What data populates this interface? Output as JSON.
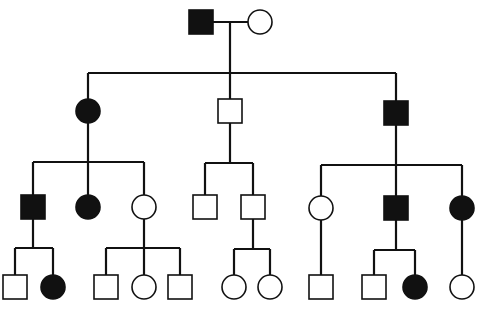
{
  "diagram": {
    "type": "pedigree",
    "colors": {
      "affected": "#111111",
      "unaffected": "#ffffff",
      "line": "#111111"
    },
    "legend_semantics": {
      "square": "male",
      "circle": "female",
      "filled": "affected",
      "open": "unaffected"
    },
    "individuals": [
      {
        "id": "I-1",
        "gen": 1,
        "sex": "male",
        "affected": true,
        "x": 201,
        "y": 22
      },
      {
        "id": "I-2",
        "gen": 1,
        "sex": "female",
        "affected": false,
        "x": 260,
        "y": 22
      },
      {
        "id": "II-1",
        "gen": 2,
        "sex": "female",
        "affected": true,
        "x": 88,
        "y": 111
      },
      {
        "id": "II-2",
        "gen": 2,
        "sex": "male",
        "affected": false,
        "x": 230,
        "y": 111
      },
      {
        "id": "II-3",
        "gen": 2,
        "sex": "male",
        "affected": true,
        "x": 396,
        "y": 113
      },
      {
        "id": "III-1",
        "gen": 3,
        "sex": "male",
        "affected": true,
        "x": 33,
        "y": 207
      },
      {
        "id": "III-2",
        "gen": 3,
        "sex": "female",
        "affected": true,
        "x": 88,
        "y": 207
      },
      {
        "id": "III-3",
        "gen": 3,
        "sex": "female",
        "affected": false,
        "x": 144,
        "y": 207
      },
      {
        "id": "III-4",
        "gen": 3,
        "sex": "male",
        "affected": false,
        "x": 205,
        "y": 207
      },
      {
        "id": "III-5",
        "gen": 3,
        "sex": "male",
        "affected": false,
        "x": 253,
        "y": 207
      },
      {
        "id": "III-6",
        "gen": 3,
        "sex": "female",
        "affected": false,
        "x": 321,
        "y": 208
      },
      {
        "id": "III-7",
        "gen": 3,
        "sex": "male",
        "affected": true,
        "x": 396,
        "y": 208
      },
      {
        "id": "III-8",
        "gen": 3,
        "sex": "female",
        "affected": true,
        "x": 462,
        "y": 208
      },
      {
        "id": "IV-1",
        "gen": 4,
        "sex": "male",
        "affected": false,
        "x": 15,
        "y": 287
      },
      {
        "id": "IV-2",
        "gen": 4,
        "sex": "female",
        "affected": true,
        "x": 53,
        "y": 287
      },
      {
        "id": "IV-3",
        "gen": 4,
        "sex": "male",
        "affected": false,
        "x": 106,
        "y": 287
      },
      {
        "id": "IV-4",
        "gen": 4,
        "sex": "female",
        "affected": false,
        "x": 144,
        "y": 287
      },
      {
        "id": "IV-5",
        "gen": 4,
        "sex": "male",
        "affected": false,
        "x": 180,
        "y": 287
      },
      {
        "id": "IV-6",
        "gen": 4,
        "sex": "female",
        "affected": false,
        "x": 234,
        "y": 287
      },
      {
        "id": "IV-7",
        "gen": 4,
        "sex": "female",
        "affected": false,
        "x": 270,
        "y": 287
      },
      {
        "id": "IV-8",
        "gen": 4,
        "sex": "male",
        "affected": false,
        "x": 321,
        "y": 287
      },
      {
        "id": "IV-9",
        "gen": 4,
        "sex": "male",
        "affected": false,
        "x": 374,
        "y": 287
      },
      {
        "id": "IV-10",
        "gen": 4,
        "sex": "female",
        "affected": true,
        "x": 415,
        "y": 287
      },
      {
        "id": "IV-11",
        "gen": 4,
        "sex": "female",
        "affected": false,
        "x": 462,
        "y": 287
      }
    ],
    "lines": [
      {
        "kind": "marriage",
        "x1": 213,
        "y1": 22,
        "x2": 248,
        "y2": 22
      },
      {
        "kind": "descent",
        "x1": 230,
        "y1": 22,
        "x2": 230,
        "y2": 73
      },
      {
        "kind": "sibship",
        "x1": 88,
        "y1": 73,
        "x2": 396,
        "y2": 73
      },
      {
        "kind": "drop",
        "x1": 88,
        "y1": 73,
        "x2": 88,
        "y2": 99
      },
      {
        "kind": "drop",
        "x1": 230,
        "y1": 73,
        "x2": 230,
        "y2": 99
      },
      {
        "kind": "drop",
        "x1": 396,
        "y1": 73,
        "x2": 396,
        "y2": 101
      },
      {
        "kind": "descent",
        "x1": 88,
        "y1": 123,
        "x2": 88,
        "y2": 162
      },
      {
        "kind": "sibship",
        "x1": 33,
        "y1": 162,
        "x2": 144,
        "y2": 162
      },
      {
        "kind": "drop",
        "x1": 33,
        "y1": 162,
        "x2": 33,
        "y2": 195
      },
      {
        "kind": "drop",
        "x1": 88,
        "y1": 162,
        "x2": 88,
        "y2": 195
      },
      {
        "kind": "drop",
        "x1": 144,
        "y1": 162,
        "x2": 144,
        "y2": 195
      },
      {
        "kind": "descent",
        "x1": 230,
        "y1": 123,
        "x2": 230,
        "y2": 163
      },
      {
        "kind": "sibship",
        "x1": 205,
        "y1": 163,
        "x2": 253,
        "y2": 163
      },
      {
        "kind": "drop",
        "x1": 205,
        "y1": 163,
        "x2": 205,
        "y2": 195
      },
      {
        "kind": "drop",
        "x1": 253,
        "y1": 163,
        "x2": 253,
        "y2": 195
      },
      {
        "kind": "descent",
        "x1": 396,
        "y1": 125,
        "x2": 396,
        "y2": 165
      },
      {
        "kind": "sibship",
        "x1": 321,
        "y1": 165,
        "x2": 462,
        "y2": 165
      },
      {
        "kind": "drop",
        "x1": 321,
        "y1": 165,
        "x2": 321,
        "y2": 196
      },
      {
        "kind": "drop",
        "x1": 396,
        "y1": 165,
        "x2": 396,
        "y2": 196
      },
      {
        "kind": "drop",
        "x1": 462,
        "y1": 165,
        "x2": 462,
        "y2": 196
      },
      {
        "kind": "descent",
        "x1": 33,
        "y1": 219,
        "x2": 33,
        "y2": 248
      },
      {
        "kind": "sibship",
        "x1": 15,
        "y1": 248,
        "x2": 53,
        "y2": 248
      },
      {
        "kind": "drop",
        "x1": 15,
        "y1": 248,
        "x2": 15,
        "y2": 275
      },
      {
        "kind": "drop",
        "x1": 53,
        "y1": 248,
        "x2": 53,
        "y2": 275
      },
      {
        "kind": "descent",
        "x1": 144,
        "y1": 219,
        "x2": 144,
        "y2": 248
      },
      {
        "kind": "sibship",
        "x1": 106,
        "y1": 248,
        "x2": 180,
        "y2": 248
      },
      {
        "kind": "drop",
        "x1": 106,
        "y1": 248,
        "x2": 106,
        "y2": 275
      },
      {
        "kind": "drop",
        "x1": 144,
        "y1": 248,
        "x2": 144,
        "y2": 275
      },
      {
        "kind": "drop",
        "x1": 180,
        "y1": 248,
        "x2": 180,
        "y2": 275
      },
      {
        "kind": "descent",
        "x1": 253,
        "y1": 219,
        "x2": 253,
        "y2": 249
      },
      {
        "kind": "sibship",
        "x1": 234,
        "y1": 249,
        "x2": 270,
        "y2": 249
      },
      {
        "kind": "drop",
        "x1": 234,
        "y1": 249,
        "x2": 234,
        "y2": 275
      },
      {
        "kind": "drop",
        "x1": 270,
        "y1": 249,
        "x2": 270,
        "y2": 275
      },
      {
        "kind": "descent",
        "x1": 321,
        "y1": 220,
        "x2": 321,
        "y2": 275
      },
      {
        "kind": "descent",
        "x1": 396,
        "y1": 220,
        "x2": 396,
        "y2": 250
      },
      {
        "kind": "sibship",
        "x1": 374,
        "y1": 250,
        "x2": 415,
        "y2": 250
      },
      {
        "kind": "drop",
        "x1": 374,
        "y1": 250,
        "x2": 374,
        "y2": 275
      },
      {
        "kind": "drop",
        "x1": 415,
        "y1": 250,
        "x2": 415,
        "y2": 275
      },
      {
        "kind": "descent",
        "x1": 462,
        "y1": 220,
        "x2": 462,
        "y2": 275
      }
    ],
    "symbol_size": 24
  }
}
